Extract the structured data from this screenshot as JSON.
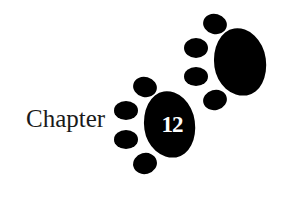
{
  "title": {
    "label": "Chapter",
    "number": "12"
  },
  "graphic": {
    "icon": "paw-prints-icon",
    "color": "#000000",
    "text_color": "#ffffff"
  }
}
